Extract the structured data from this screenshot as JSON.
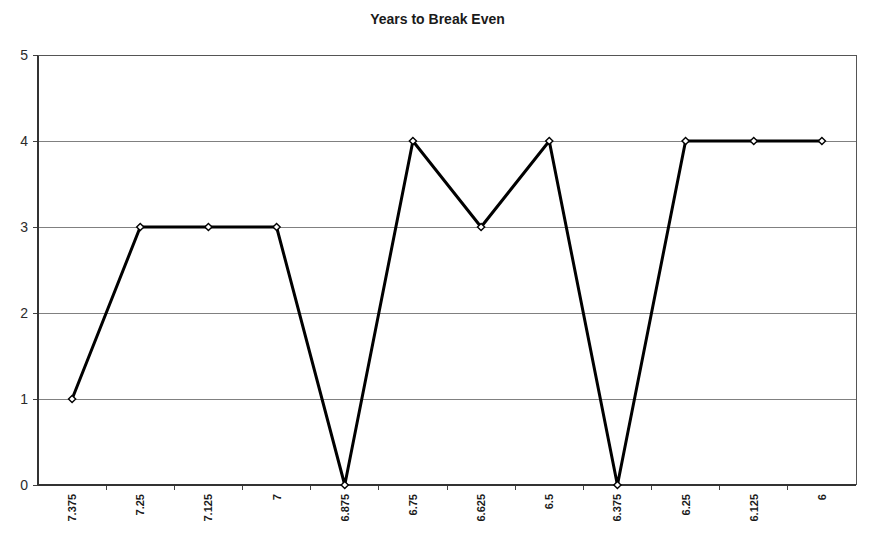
{
  "chart_data": {
    "type": "line",
    "title": "Years to Break Even",
    "xlabel": "",
    "ylabel": "",
    "categories": [
      "7.375",
      "7.25",
      "7.125",
      "7",
      "6.875",
      "6.75",
      "6.625",
      "6.5",
      "6.375",
      "6.25",
      "6.125",
      "6"
    ],
    "values": [
      1,
      3,
      3,
      3,
      0,
      4,
      3,
      4,
      0,
      4,
      4,
      4
    ],
    "ylim": [
      0,
      5
    ],
    "yticks": [
      "0",
      "1",
      "2",
      "3",
      "4",
      "5"
    ],
    "grid": "horizontal",
    "legend": "none",
    "series_color": "#000000",
    "marker": "open-diamond",
    "gridline_color": "#808080",
    "axis_color": "#404040"
  },
  "axis": {
    "y_tick_labels": [
      "5",
      "4",
      "3",
      "2",
      "1",
      "0"
    ],
    "x_tick_labels": [
      "7.375",
      "7.25",
      "7.125",
      "7",
      "6.875",
      "6.75",
      "6.625",
      "6.5",
      "6.375",
      "6.25",
      "6.125",
      "6"
    ]
  }
}
